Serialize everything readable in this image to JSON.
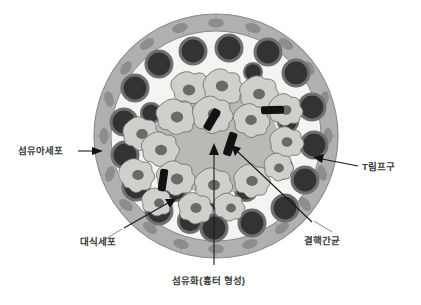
{
  "figure": {
    "type": "biological-diagram",
    "background_color": "#ffffff"
  },
  "labels": {
    "fibroblast": "섬유아세포",
    "t_lymphocyte": "T림프구",
    "macrophage": "대식세포",
    "tubercle_bacillus": "결핵간균",
    "fibrosis": "섬유화(흉터 형성)"
  },
  "colors": {
    "outer_rim_fill": "#b0b0b0",
    "outer_rim_stroke": "#8a8a8a",
    "rim_nucleus": "#8f8f8f",
    "interstitium": "#f2f2f0",
    "lymphocyte_fill": "#3a3a3a",
    "lymphocyte_ring": "#6e6e6e",
    "macrophage_fill": "#cfcfcc",
    "macrophage_stroke": "#6e6e6e",
    "macrophage_nucleus": "#6a6a6a",
    "fibrotic_core": "#b9b9b6",
    "bacillus": "#111111",
    "leader_line": "#6b6b6b",
    "pointer_line": "#1a1a1a",
    "text": "#3a3a3a"
  },
  "structures": {
    "outer_capsule": {
      "label_ref": "fibroblast",
      "description": "fibroblast capsule with elongated nuclei",
      "cells": 20
    },
    "lymphocyte_ring": {
      "label_ref": "t_lymphocyte",
      "description": "ring of dark round T lymphocytes",
      "cells": 24
    },
    "epithelioid_zone": {
      "label_ref": "macrophage",
      "description": "epithelioid macrophages with pale cytoplasm",
      "cells": 38
    },
    "central_zone": {
      "label_ref": "fibrosis",
      "description": "central fibrotic scar area"
    },
    "bacilli": {
      "label_ref": "tubercle_bacillus",
      "description": "black rod-shaped bacilli",
      "count": 4
    }
  },
  "geometry": {
    "center_x": 216,
    "center_y": 136,
    "radius": 123
  }
}
